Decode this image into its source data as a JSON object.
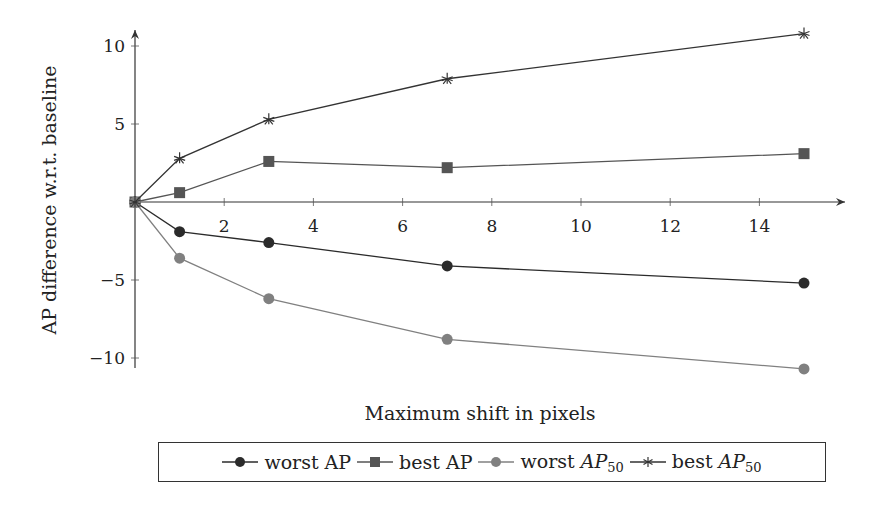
{
  "chart_data": {
    "type": "line",
    "title": "",
    "xlabel": "Maximum shift in pixels",
    "ylabel": "AP difference w.r.t. baseline",
    "x": [
      0,
      1,
      3,
      7,
      15
    ],
    "xticks": [
      2,
      4,
      6,
      8,
      10,
      12,
      14
    ],
    "yticks": [
      -10,
      -5,
      5,
      10
    ],
    "xlim": [
      0,
      16
    ],
    "ylim": [
      -11,
      11.5
    ],
    "grid": false,
    "legend_position": "bottom",
    "series": [
      {
        "name": "worst AP",
        "marker": "circle",
        "color": "#2b2b2b",
        "values": [
          0,
          -1.9,
          -2.6,
          -4.1,
          -5.2
        ]
      },
      {
        "name": "best AP",
        "marker": "square",
        "color": "#555555",
        "values": [
          0,
          0.6,
          2.6,
          2.2,
          3.1
        ]
      },
      {
        "name": "worst AP50",
        "marker": "circle",
        "color": "#808080",
        "values": [
          0,
          -3.6,
          -6.2,
          -8.8,
          -10.7
        ]
      },
      {
        "name": "best AP50",
        "marker": "star",
        "color": "#333333",
        "values": [
          0,
          2.8,
          5.3,
          7.9,
          10.8
        ]
      }
    ]
  },
  "legend": {
    "items": [
      {
        "prefix": "worst AP",
        "main": "",
        "sub": ""
      },
      {
        "prefix": "best AP",
        "main": "",
        "sub": ""
      },
      {
        "prefix": "worst ",
        "main": "AP",
        "sub": "50"
      },
      {
        "prefix": "best ",
        "main": "AP",
        "sub": "50"
      }
    ]
  }
}
